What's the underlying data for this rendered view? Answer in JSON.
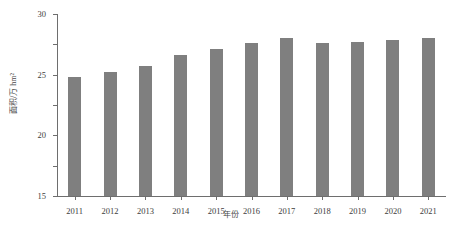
{
  "chart_data": {
    "type": "bar",
    "title": "",
    "subtitle": "",
    "xlabel": "年份",
    "ylabel": "面积/万 hm²",
    "categories": [
      "2011",
      "2012",
      "2013",
      "2014",
      "2015",
      "2016",
      "2017",
      "2018",
      "2019",
      "2020",
      "2021"
    ],
    "values": [
      19.6,
      20.4,
      21.5,
      23.2,
      24.2,
      25.2,
      26.0,
      25.3,
      25.4,
      25.7,
      26.0
    ],
    "series": [
      {
        "name": "面积",
        "values": [
          19.6,
          20.4,
          21.5,
          23.2,
          24.2,
          25.2,
          26.0,
          25.3,
          25.4,
          25.7,
          26.0
        ]
      }
    ],
    "ylim": [
      0,
      30
    ],
    "yticks": [
      0,
      5,
      10,
      15,
      20,
      25,
      30
    ],
    "ytick_labels": [
      "0",
      "5",
      "10",
      "15",
      "20",
      "25",
      "30"
    ],
    "grid": false,
    "legend": false,
    "legend_position": "none",
    "bar_color": "#7f7f7f",
    "axis_color": "#6e6e6e",
    "background_color": "#ffffff"
  }
}
